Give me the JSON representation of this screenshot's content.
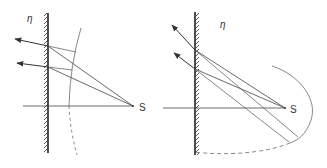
{
  "figure": {
    "left_panel": {
      "eta_label": "η",
      "source_label": "S"
    },
    "right_panel": {
      "eta_label": "η",
      "source_label": "S"
    }
  },
  "colors": {
    "ink": "#333333",
    "background": "#ffffff"
  }
}
